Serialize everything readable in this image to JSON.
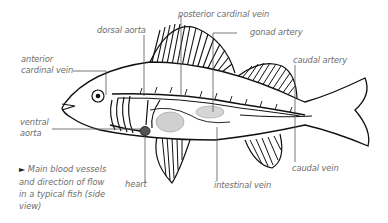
{
  "diagram": {
    "labels": {
      "dorsal_aorta": "dorsal aorta",
      "posterior_cardinal_vein": "posterior cardinal vein",
      "gonad_artery": "gonad artery",
      "anterior_cardinal_vein_line1": "anterior",
      "anterior_cardinal_vein_line2": "cardinal vein",
      "caudal_artery": "caudal artery",
      "ventral_aorta_line1": "ventral",
      "ventral_aorta_line2": "aorta",
      "heart": "heart",
      "intestinal_vein": "intestinal vein",
      "caudal_vein": "caudal vein"
    },
    "caption": {
      "marker": "►",
      "text": "Main blood vessels and direction of flow in a typical fish (side view)"
    },
    "colors": {
      "label_text": "#6e6e6e",
      "leader_line": "#555555",
      "outline": "#111111",
      "organ_shade": "#cfcfcf"
    }
  }
}
